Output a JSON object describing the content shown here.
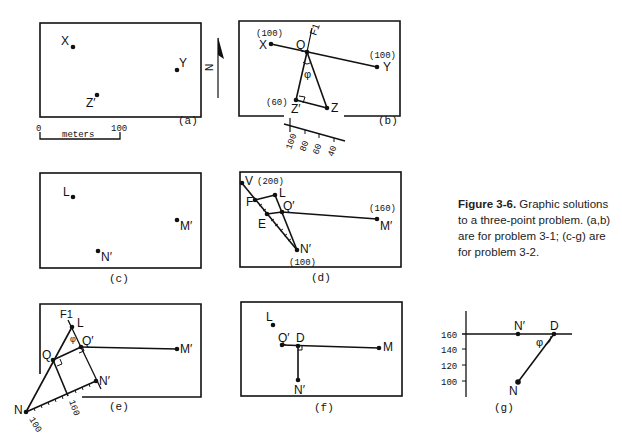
{
  "figure": {
    "caption": {
      "label": "Figure 3-6.",
      "text": "Graphic solutions to a three-point problem. (a,b) are for problem 3-1; (c-g) are for problem 3-2."
    },
    "north_arrow": {
      "label": "N"
    },
    "panels": {
      "a": {
        "label": "(a)",
        "points": {
          "X": "X",
          "Y": "Y",
          "Z": "Z′"
        },
        "scale_bar": {
          "start": "0",
          "end": "100",
          "unit": "meters"
        }
      },
      "b": {
        "label": "(b)",
        "points": {
          "X": "X",
          "Y": "Y",
          "Q": "Q",
          "Z_prime": "Z′",
          "Z": "Z",
          "F1": "F1"
        },
        "elevations": {
          "X": "(100)",
          "Y": "(100)",
          "Z_prime": "(60)"
        },
        "angle": "φ",
        "scale_ticks": [
          "100",
          "80",
          "60",
          "40"
        ]
      },
      "c": {
        "label": "(c)",
        "points": {
          "L": "L",
          "M": "M′",
          "N": "N′"
        }
      },
      "d": {
        "label": "(d)",
        "points": {
          "V": "V",
          "L": "L",
          "F": "F",
          "E": "E",
          "Q": "Q′",
          "M": "M′",
          "N": "N′"
        },
        "elevations": {
          "V": "(200)",
          "M": "(160)",
          "N": "(100)"
        }
      },
      "e": {
        "label": "(e)",
        "points": {
          "F1": "F1",
          "L": "L",
          "Q": "Q",
          "Q_prime": "Q′",
          "M": "M′",
          "N_prime": "N′",
          "N": "N"
        },
        "angle": "φ",
        "scale_ticks": [
          "160",
          "100"
        ]
      },
      "f": {
        "label": "(f)",
        "points": {
          "L": "L",
          "Q": "Q′",
          "D": "D",
          "M": "M",
          "N": "N′"
        }
      },
      "g": {
        "label": "(g)",
        "points": {
          "N_prime": "N′",
          "D": "D",
          "N": "N"
        },
        "angle": "φ",
        "y_ticks": [
          "160",
          "140",
          "120",
          "100"
        ]
      }
    }
  }
}
